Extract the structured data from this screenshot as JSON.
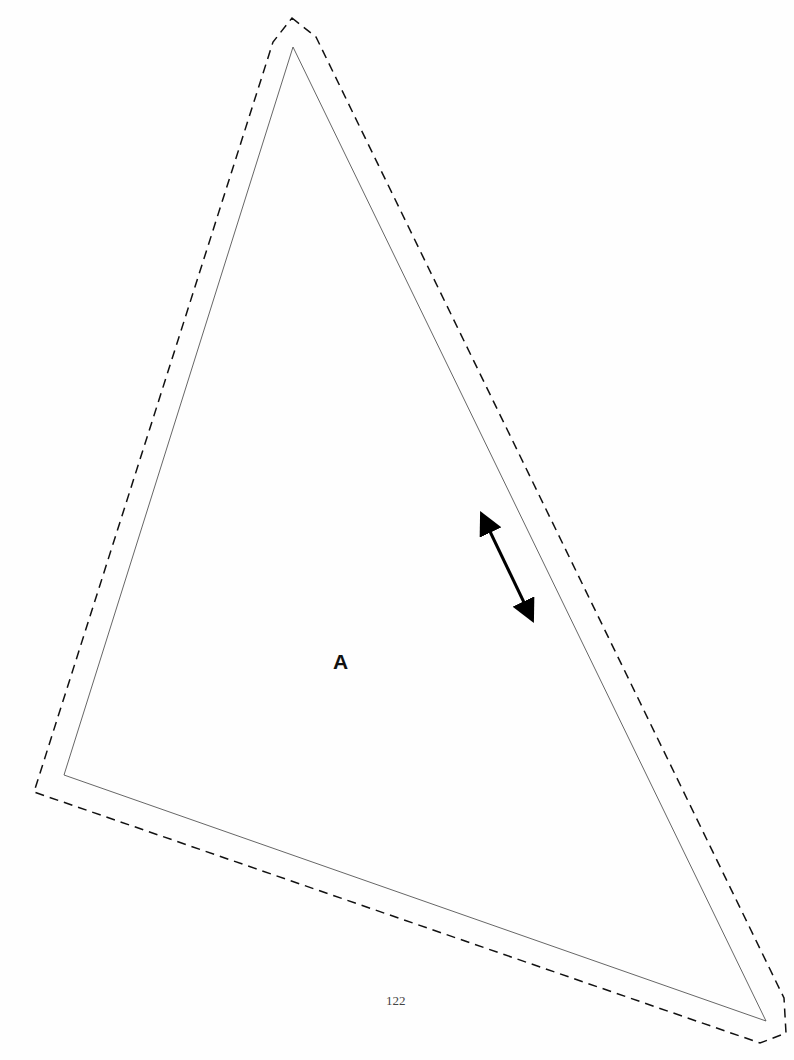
{
  "template": {
    "piece_label": "A",
    "page_number": "122",
    "cut_line": {
      "style": "solid",
      "points": [
        [
          293,
          47
        ],
        [
          64,
          775
        ],
        [
          766,
          1021
        ]
      ]
    },
    "seam_allowance_line": {
      "style": "dashed",
      "points": [
        [
          292,
          18
        ],
        [
          316,
          37
        ],
        [
          784,
          998
        ],
        [
          786,
          1033
        ],
        [
          760,
          1043
        ],
        [
          34,
          792
        ],
        [
          273,
          42
        ]
      ]
    },
    "grainline_arrow": {
      "from": [
        482,
        515
      ],
      "to": [
        533,
        620
      ]
    }
  }
}
